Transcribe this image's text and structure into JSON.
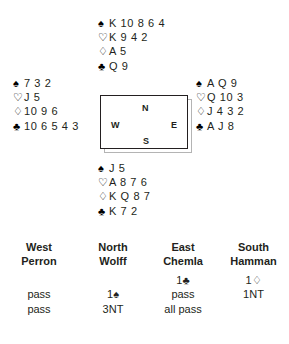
{
  "deal": {
    "hands": {
      "north": {
        "position": "North",
        "suits": [
          {
            "suit": "spades",
            "symbol": "♠",
            "filled": true,
            "ranks": "K 10 8 6 4"
          },
          {
            "suit": "hearts",
            "symbol": "♡",
            "filled": false,
            "ranks": "K 9 4 2"
          },
          {
            "suit": "diamonds",
            "symbol": "♢",
            "filled": false,
            "ranks": "A 5"
          },
          {
            "suit": "clubs",
            "symbol": "♣",
            "filled": true,
            "ranks": "Q 9"
          }
        ]
      },
      "west": {
        "position": "West",
        "suits": [
          {
            "suit": "spades",
            "symbol": "♠",
            "filled": true,
            "ranks": "7 3 2"
          },
          {
            "suit": "hearts",
            "symbol": "♡",
            "filled": false,
            "ranks": "J 5"
          },
          {
            "suit": "diamonds",
            "symbol": "♢",
            "filled": false,
            "ranks": "10 9 6"
          },
          {
            "suit": "clubs",
            "symbol": "♣",
            "filled": true,
            "ranks": "10 6 5 4 3"
          }
        ]
      },
      "east": {
        "position": "East",
        "suits": [
          {
            "suit": "spades",
            "symbol": "♠",
            "filled": true,
            "ranks": "A Q 9"
          },
          {
            "suit": "hearts",
            "symbol": "♡",
            "filled": false,
            "ranks": "Q 10 3"
          },
          {
            "suit": "diamonds",
            "symbol": "♢",
            "filled": false,
            "ranks": "J 4 3 2"
          },
          {
            "suit": "clubs",
            "symbol": "♣",
            "filled": true,
            "ranks": "A J 8"
          }
        ]
      },
      "south": {
        "position": "South",
        "suits": [
          {
            "suit": "spades",
            "symbol": "♠",
            "filled": true,
            "ranks": "J 5"
          },
          {
            "suit": "hearts",
            "symbol": "♡",
            "filled": false,
            "ranks": "A 8 7 6"
          },
          {
            "suit": "diamonds",
            "symbol": "♢",
            "filled": false,
            "ranks": "K Q 8 7"
          },
          {
            "suit": "clubs",
            "symbol": "♣",
            "filled": true,
            "ranks": "K 7 2"
          }
        ]
      }
    },
    "compass": {
      "north": "N",
      "west": "W",
      "east": "E",
      "south": "S"
    }
  },
  "auction": {
    "headers": [
      {
        "seat": "West",
        "player": "Perron"
      },
      {
        "seat": "North",
        "player": "Wolff"
      },
      {
        "seat": "East",
        "player": "Chemla"
      },
      {
        "seat": "South",
        "player": "Hamman"
      }
    ],
    "rows": [
      {
        "west": "",
        "north": "",
        "east": "1♣",
        "south": "1♢"
      },
      {
        "west": "pass",
        "north": "1♠",
        "east": "pass",
        "south": "1NT"
      },
      {
        "west": "pass",
        "north": "3NT",
        "east": "all pass",
        "south": ""
      }
    ]
  },
  "colors": {
    "text": "#231f20",
    "background": "#ffffff",
    "box_border": "#231f20",
    "box_shadow": "#b4b4b4"
  }
}
